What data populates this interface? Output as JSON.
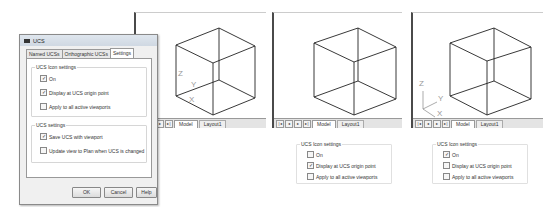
{
  "dialog": {
    "title": "UCS",
    "tabs": [
      {
        "label": "Named UCSs",
        "active": false
      },
      {
        "label": "Orthographic UCSs",
        "active": false
      },
      {
        "label": "Settings",
        "active": true
      }
    ],
    "icon_settings": {
      "label": "UCS Icon settings",
      "options": [
        {
          "label": "On",
          "checked": true
        },
        {
          "label": "Display at UCS origin point",
          "checked": true
        },
        {
          "label": "Apply to all active viewports",
          "checked": false
        }
      ]
    },
    "ucs_settings": {
      "label": "UCS settings",
      "options": [
        {
          "label": "Save UCS with viewport",
          "checked": true
        },
        {
          "label": "Update view to Plan when UCS is changed",
          "checked": false
        }
      ]
    },
    "buttons": {
      "ok": "OK",
      "cancel": "Cancel",
      "help": "Help"
    }
  },
  "viewports": [
    {
      "tabs": {
        "model": "Model",
        "layout": "Layout1"
      },
      "nav": [
        "|◂",
        "◂",
        "▸",
        "▸|"
      ],
      "ucs_icon": {
        "z": "Z",
        "y": "Y",
        "x": "X"
      }
    },
    {
      "tabs": {
        "model": "Model",
        "layout": "Layout1"
      },
      "nav": [
        "|◂",
        "◂",
        "▸",
        "▸|"
      ]
    },
    {
      "tabs": {
        "model": "Model",
        "layout": "Layout1"
      },
      "nav": [
        "|◂",
        "◂",
        "▸",
        "▸|"
      ],
      "ucs_icon": {
        "z": "Z",
        "y": "Y",
        "x": "X"
      }
    }
  ],
  "panels": [
    {
      "label": "UCS Icon settings",
      "options": [
        {
          "label": "On",
          "checked": false
        },
        {
          "label": "Display at UCS origin point",
          "checked": true
        },
        {
          "label": "Apply to all active viewports",
          "checked": false
        }
      ]
    },
    {
      "label": "UCS Icon settings",
      "options": [
        {
          "label": "On",
          "checked": true
        },
        {
          "label": "Display at UCS origin point",
          "checked": false
        },
        {
          "label": "Apply to all active viewports",
          "checked": false
        }
      ]
    }
  ],
  "glyphs": {
    "check": "✓",
    "empty": ""
  }
}
